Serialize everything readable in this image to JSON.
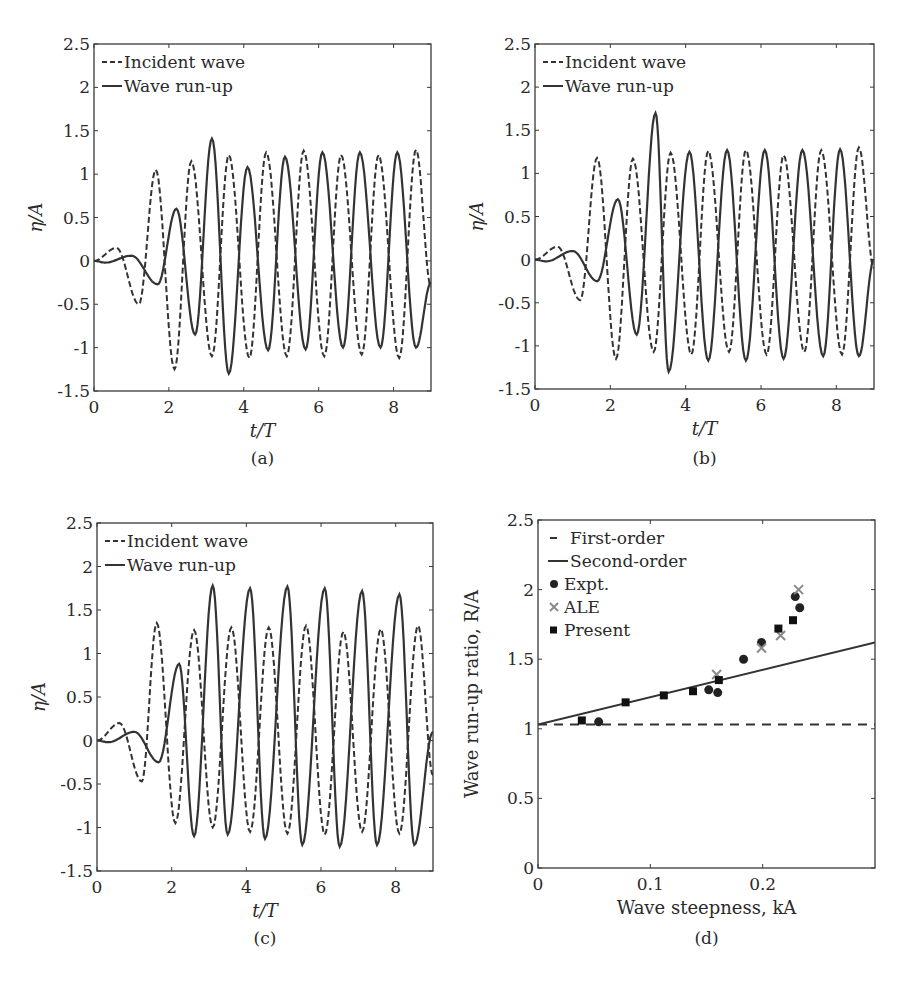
{
  "chart_data": [
    {
      "id": "a",
      "type": "line",
      "caption": "(a)",
      "xlabel": "t/T",
      "ylabel": "η/A",
      "xlim": [
        0,
        9
      ],
      "ylim": [
        -1.5,
        2.5
      ],
      "xticks": [
        0,
        2,
        4,
        6,
        8
      ],
      "yticks": [
        -1.5,
        -1,
        -0.5,
        0,
        0.5,
        1,
        1.5,
        2,
        2.5
      ],
      "grid": false,
      "legend_position": "upper left",
      "series": [
        {
          "name": "Incident wave",
          "style": "dashed",
          "extrema": [
            [
              0,
              0
            ],
            [
              0.6,
              0.15
            ],
            [
              1.2,
              -0.5
            ],
            [
              1.65,
              1.05
            ],
            [
              2.15,
              -1.25
            ],
            [
              2.6,
              1.15
            ],
            [
              3.15,
              -1.1
            ],
            [
              3.6,
              1.22
            ],
            [
              4.15,
              -1.12
            ],
            [
              4.6,
              1.25
            ],
            [
              5.15,
              -1.1
            ],
            [
              5.6,
              1.27
            ],
            [
              6.15,
              -1.1
            ],
            [
              6.6,
              1.22
            ],
            [
              7.15,
              -1.08
            ],
            [
              7.6,
              1.22
            ],
            [
              8.15,
              -1.12
            ],
            [
              8.6,
              1.28
            ],
            [
              9,
              -0.3
            ]
          ]
        },
        {
          "name": "Wave run-up",
          "style": "solid",
          "extrema": [
            [
              0,
              0
            ],
            [
              0.3,
              -0.02
            ],
            [
              1.0,
              0.06
            ],
            [
              1.7,
              -0.27
            ],
            [
              2.2,
              0.6
            ],
            [
              2.7,
              -0.85
            ],
            [
              3.15,
              1.41
            ],
            [
              3.6,
              -1.3
            ],
            [
              4.1,
              1.08
            ],
            [
              4.65,
              -1.03
            ],
            [
              5.1,
              1.2
            ],
            [
              5.65,
              -1.02
            ],
            [
              6.1,
              1.25
            ],
            [
              6.65,
              -1.0
            ],
            [
              7.1,
              1.25
            ],
            [
              7.65,
              -1.0
            ],
            [
              8.1,
              1.25
            ],
            [
              8.6,
              -1.0
            ],
            [
              9,
              -0.25
            ]
          ]
        }
      ]
    },
    {
      "id": "b",
      "type": "line",
      "caption": "(b)",
      "xlabel": "t/T",
      "ylabel": "η/A",
      "xlim": [
        0,
        9
      ],
      "ylim": [
        -1.5,
        2.5
      ],
      "xticks": [
        0,
        2,
        4,
        6,
        8
      ],
      "yticks": [
        -1.5,
        -1,
        -0.5,
        0,
        0.5,
        1,
        1.5,
        2,
        2.5
      ],
      "grid": false,
      "legend_position": "upper left",
      "series": [
        {
          "name": "Incident wave",
          "style": "dashed",
          "extrema": [
            [
              0,
              0
            ],
            [
              0.6,
              0.15
            ],
            [
              1.2,
              -0.47
            ],
            [
              1.65,
              1.18
            ],
            [
              2.15,
              -1.15
            ],
            [
              2.6,
              1.17
            ],
            [
              3.15,
              -1.07
            ],
            [
              3.6,
              1.24
            ],
            [
              4.15,
              -1.1
            ],
            [
              4.6,
              1.26
            ],
            [
              5.15,
              -1.07
            ],
            [
              5.6,
              1.27
            ],
            [
              6.15,
              -1.1
            ],
            [
              6.6,
              1.21
            ],
            [
              7.15,
              -1.07
            ],
            [
              7.6,
              1.27
            ],
            [
              8.15,
              -1.1
            ],
            [
              8.6,
              1.3
            ],
            [
              9,
              -0.1
            ]
          ]
        },
        {
          "name": "Wave run-up",
          "style": "solid",
          "extrema": [
            [
              0,
              0
            ],
            [
              0.3,
              -0.02
            ],
            [
              1.0,
              0.1
            ],
            [
              1.65,
              -0.25
            ],
            [
              2.2,
              0.7
            ],
            [
              2.7,
              -0.87
            ],
            [
              3.2,
              1.7
            ],
            [
              3.55,
              -1.3
            ],
            [
              4.1,
              1.25
            ],
            [
              4.6,
              -1.17
            ],
            [
              5.1,
              1.27
            ],
            [
              5.6,
              -1.17
            ],
            [
              6.1,
              1.27
            ],
            [
              6.6,
              -1.15
            ],
            [
              7.1,
              1.27
            ],
            [
              7.65,
              -1.12
            ],
            [
              8.1,
              1.28
            ],
            [
              8.6,
              -1.12
            ],
            [
              9,
              0.0
            ]
          ]
        }
      ]
    },
    {
      "id": "c",
      "type": "line",
      "caption": "(c)",
      "xlabel": "t/T",
      "ylabel": "η/A",
      "xlim": [
        0,
        9
      ],
      "ylim": [
        -1.5,
        2.5
      ],
      "xticks": [
        0,
        2,
        4,
        6,
        8
      ],
      "yticks": [
        -1.5,
        -1,
        -0.5,
        0,
        0.5,
        1,
        1.5,
        2,
        2.5
      ],
      "grid": false,
      "legend_position": "upper left",
      "series": [
        {
          "name": "Incident wave",
          "style": "dashed",
          "extrema": [
            [
              0,
              0
            ],
            [
              0.6,
              0.2
            ],
            [
              1.2,
              -0.47
            ],
            [
              1.6,
              1.35
            ],
            [
              2.1,
              -0.95
            ],
            [
              2.6,
              1.27
            ],
            [
              3.1,
              -1.0
            ],
            [
              3.6,
              1.3
            ],
            [
              4.1,
              -1.05
            ],
            [
              4.6,
              1.3
            ],
            [
              5.1,
              -1.07
            ],
            [
              5.6,
              1.32
            ],
            [
              6.1,
              -1.08
            ],
            [
              6.6,
              1.25
            ],
            [
              7.1,
              -1.05
            ],
            [
              7.6,
              1.28
            ],
            [
              8.1,
              -1.07
            ],
            [
              8.6,
              1.32
            ],
            [
              9,
              -0.4
            ]
          ]
        },
        {
          "name": "Wave run-up",
          "style": "solid",
          "extrema": [
            [
              0,
              0
            ],
            [
              0.3,
              -0.02
            ],
            [
              1.0,
              0.1
            ],
            [
              1.65,
              -0.25
            ],
            [
              2.2,
              0.88
            ],
            [
              2.6,
              -1.1
            ],
            [
              3.1,
              1.78
            ],
            [
              3.5,
              -1.08
            ],
            [
              4.1,
              1.75
            ],
            [
              4.5,
              -1.13
            ],
            [
              5.1,
              1.77
            ],
            [
              5.5,
              -1.2
            ],
            [
              6.1,
              1.75
            ],
            [
              6.5,
              -1.22
            ],
            [
              7.1,
              1.72
            ],
            [
              7.5,
              -1.2
            ],
            [
              8.1,
              1.68
            ],
            [
              8.5,
              -1.2
            ],
            [
              9,
              0.1
            ]
          ]
        }
      ]
    },
    {
      "id": "d",
      "type": "scatter",
      "caption": "(d)",
      "xlabel": "Wave steepness, kA",
      "ylabel": "Wave run-up ratio, R/A",
      "xlim": [
        0,
        0.3
      ],
      "ylim": [
        0,
        2.5
      ],
      "xticks": [
        0,
        0.1,
        0.2
      ],
      "yticks": [
        0,
        0.5,
        1,
        1.5,
        2,
        2.5
      ],
      "grid": false,
      "legend_position": "upper left",
      "series": [
        {
          "name": "First-order",
          "style": "dashed",
          "kind": "line",
          "x": [
            0,
            0.3
          ],
          "y": [
            1.03,
            1.03
          ]
        },
        {
          "name": "Second-order",
          "style": "solid",
          "kind": "line",
          "x": [
            0,
            0.3
          ],
          "y": [
            1.03,
            1.62
          ]
        },
        {
          "name": "Expt.",
          "marker": "circle",
          "color": "#222222",
          "x": [
            0.054,
            0.152,
            0.16,
            0.183,
            0.199,
            0.229,
            0.233
          ],
          "y": [
            1.05,
            1.28,
            1.26,
            1.5,
            1.62,
            1.95,
            1.87
          ]
        },
        {
          "name": "ALE",
          "marker": "x",
          "color": "#8a8a8a",
          "x": [
            0.159,
            0.199,
            0.216,
            0.232
          ],
          "y": [
            1.39,
            1.58,
            1.67,
            2.0
          ]
        },
        {
          "name": "Present",
          "marker": "square",
          "color": "#111111",
          "x": [
            0.039,
            0.078,
            0.112,
            0.138,
            0.161,
            0.214,
            0.227
          ],
          "y": [
            1.06,
            1.19,
            1.24,
            1.27,
            1.35,
            1.72,
            1.78
          ]
        }
      ]
    }
  ]
}
